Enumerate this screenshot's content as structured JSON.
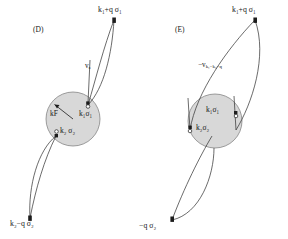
{
  "figure": {
    "type": "feynman-scattering-diagrams",
    "background": "#ffffff",
    "ink_color": "#2b2b2b",
    "fermi_sphere_fill": "#d6d6d6",
    "fermi_sphere_stroke": "#6b6b6b"
  },
  "panels": [
    {
      "tag": "(D)",
      "name": "direct-term",
      "interaction_label": "v",
      "interaction_sub": "q",
      "fermi_radius_label": "k",
      "fermi_radius_sub": "F",
      "inner_states": [
        {
          "momentum": "k",
          "momentum_sub": "1",
          "spin": "σ",
          "spin_sub": "1"
        },
        {
          "momentum": "k",
          "momentum_sub": "2",
          "spin": "σ",
          "spin_sub": "2"
        }
      ],
      "outer_states": [
        {
          "position": "top-right",
          "momentum": "k",
          "momentum_sub": "1",
          "operator": "+q",
          "spin": "σ",
          "spin_sub": "1"
        },
        {
          "position": "bottom-left",
          "momentum": "k",
          "momentum_sub": "2",
          "operator": "−q",
          "spin": "σ",
          "spin_sub": "2"
        }
      ]
    },
    {
      "tag": "(E)",
      "name": "exchange-term",
      "interaction_label": "−v",
      "interaction_sub": "k₁−k₂−q",
      "inner_states": [
        {
          "momentum": "k",
          "momentum_sub": "1",
          "spin": "σ",
          "spin_sub": "1"
        },
        {
          "momentum": "k",
          "momentum_sub": "2",
          "spin": "σ",
          "spin_sub": "2"
        }
      ],
      "outer_states": [
        {
          "position": "top-right",
          "momentum": "k",
          "momentum_sub": "1",
          "operator": "+q",
          "spin": "σ",
          "spin_sub": "1"
        },
        {
          "position": "bottom-left",
          "momentum": "k",
          "momentum_sub": "2",
          "operator": "−q",
          "spin": "σ",
          "spin_sub": "2",
          "clipped": true
        }
      ]
    }
  ],
  "labels": {
    "panel_d_tag": "(D)",
    "panel_e_tag": "(E)",
    "d_top_right": "k₁+q σ₁",
    "d_bottom_left": "k₂−q σ₂",
    "d_inner_1": "k₁σ₁",
    "d_inner_2": "k₂ σ₂",
    "d_kf": "kF",
    "d_vq": "vₓ",
    "e_top_right": "k₁+q σ₁",
    "e_bottom_left": "−q σ₂",
    "e_inner_1": "k₁σ₁",
    "e_inner_2": "k₂σ₂",
    "e_v": "−v"
  }
}
